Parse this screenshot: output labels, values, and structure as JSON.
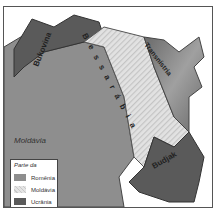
{
  "map": {
    "regions": [
      {
        "name": "Bukovina",
        "label": "Bukovina"
      },
      {
        "name": "Bessarabia",
        "label": "Bessarábia"
      },
      {
        "name": "Transnistria",
        "label": "Transnístria"
      },
      {
        "name": "Budjak",
        "label": "Budjak"
      }
    ],
    "country_label": "Moldávia",
    "colors": {
      "romania": "#8e8e8e",
      "moldavia": "#d8d8d8",
      "ucrania": "#5a5a5a"
    }
  },
  "legend": {
    "title": "Parte da",
    "items": [
      {
        "label": "Romênia"
      },
      {
        "label": "Moldávia"
      },
      {
        "label": "Ucrânia"
      }
    ]
  }
}
